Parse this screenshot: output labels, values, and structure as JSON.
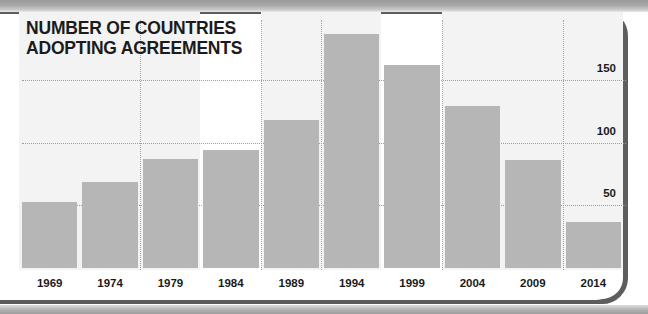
{
  "chart_data": {
    "type": "bar",
    "title_line_1": "NUMBER OF COUNTRIES",
    "title_line_2": "ADOPTING AGREEMENTS",
    "xlabel": "",
    "ylabel": "",
    "categories": [
      "1969",
      "1974",
      "1979",
      "1984",
      "1989",
      "1994",
      "1999",
      "2004",
      "2009",
      "2014"
    ],
    "values": [
      53,
      69,
      87,
      94,
      118,
      187,
      162,
      129,
      86,
      37
    ],
    "ylim": [
      0,
      200
    ],
    "ytick_labels": [
      "50",
      "100",
      "150"
    ],
    "ytick_values": [
      50,
      100,
      150
    ],
    "grid": "horizontal-dotted-and-vertical-dotted",
    "legend": null,
    "legend_position": "none",
    "bar_color": "#b6b6b6",
    "text_color": "#1b1b1b",
    "gridline_color": "#9d9d9d",
    "band_color": "#f3f3f3",
    "background": "#ffffff",
    "frame_color": "#5d5d5d"
  }
}
